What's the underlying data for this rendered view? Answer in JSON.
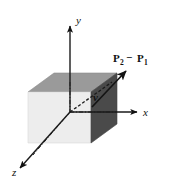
{
  "figure": {
    "background_color": "#ffffff",
    "width": 175,
    "height": 183
  },
  "axes": {
    "x_label": "x",
    "y_label": "y",
    "z_label": "z",
    "line_color": "#1a1a1a",
    "arrow_color": "#111111"
  },
  "cube": {
    "top_face_color": "#9a9a9a",
    "left_face_color": "#ededed",
    "right_face_color": "#4a4a4a",
    "edge_color": "#6e6e6e"
  },
  "vector": {
    "label_p2": "P",
    "label_p2_sub": "2",
    "label_minus": "−",
    "label_p1": "P",
    "label_p1_sub": "1",
    "label_v": "v",
    "arrow_color": "#141414",
    "dash_color": "#1a1a1a"
  }
}
